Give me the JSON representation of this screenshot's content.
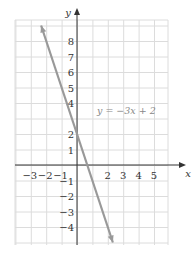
{
  "chart_data": {
    "type": "line",
    "title": "",
    "xlabel": "x",
    "ylabel": "y",
    "xlim": [
      -3.4,
      5.8
    ],
    "ylim": [
      -5,
      9.3
    ],
    "grid": true,
    "x_ticks": [
      "−3",
      "−2",
      "−1",
      "2",
      "3",
      "4",
      "5"
    ],
    "x_tick_values": [
      -3,
      -2,
      -1,
      2,
      3,
      4,
      5
    ],
    "y_ticks": [
      "8",
      "7",
      "6",
      "5",
      "4",
      "2",
      "1",
      "−1",
      "−2",
      "−3",
      "−4"
    ],
    "y_tick_values": [
      8,
      7,
      6,
      5,
      4,
      2,
      1,
      -1,
      -2,
      -3,
      -4
    ],
    "series": [
      {
        "name": "y = −3x + 2",
        "slope": -3,
        "intercept": 2,
        "x": [
          -2.33,
          2.33
        ],
        "y": [
          9,
          -5
        ],
        "color": "#999999"
      }
    ],
    "annotations": [
      {
        "text": "y = −3x + 2",
        "x": 1.5,
        "y": 3.3
      }
    ]
  }
}
